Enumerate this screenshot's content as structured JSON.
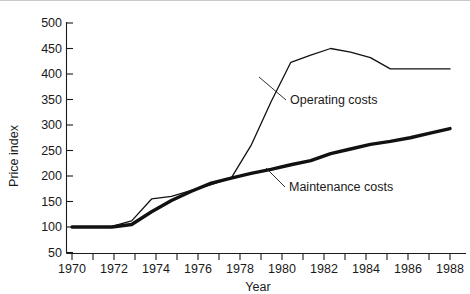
{
  "chart_data": {
    "type": "line",
    "title": "",
    "xlabel": "Year",
    "ylabel": "Price index",
    "xlim": [
      1970,
      1989
    ],
    "ylim": [
      50,
      500
    ],
    "grid": false,
    "legend_position": "inline-annotations",
    "x_ticks_major": [
      1970,
      1972,
      1974,
      1976,
      1978,
      1980,
      1982,
      1984,
      1986,
      1988
    ],
    "x_ticks_minor": [
      1971,
      1973,
      1975,
      1977,
      1979,
      1981,
      1983,
      1985,
      1987,
      1989
    ],
    "y_ticks": [
      50,
      100,
      150,
      200,
      250,
      300,
      350,
      400,
      450,
      500
    ],
    "x": [
      1970,
      1971,
      1972,
      1973,
      1974,
      1975,
      1976,
      1977,
      1978,
      1979,
      1980,
      1981,
      1982,
      1983,
      1984,
      1985,
      1986,
      1987,
      1988,
      1989
    ],
    "series": [
      {
        "name": "Operating costs",
        "style": "thin",
        "values": [
          100,
          100,
          101,
          112,
          155,
          160,
          172,
          183,
          196,
          260,
          345,
          423,
          437,
          450,
          443,
          432,
          410,
          410,
          410,
          410
        ]
      },
      {
        "name": "Maintenance costs",
        "style": "thick",
        "values": [
          100,
          100,
          100,
          105,
          130,
          152,
          170,
          186,
          196,
          205,
          213,
          222,
          230,
          244,
          253,
          262,
          268,
          275,
          284,
          293
        ]
      }
    ],
    "annotations": [
      {
        "text": "Operating costs",
        "label_x": 290,
        "label_y": 103,
        "leader_from_x": 286,
        "leader_from_y": 99,
        "leader_to_x": 259,
        "leader_to_y": 76
      },
      {
        "text": "Maintenance costs",
        "label_x": 289,
        "label_y": 190,
        "leader_from_x": 285,
        "leader_from_y": 186,
        "leader_to_x": 266,
        "leader_to_y": 167
      }
    ]
  },
  "axes": {
    "y_title": "Price index",
    "x_title": "Year",
    "y_tick_labels": [
      "500",
      "450",
      "400",
      "350",
      "300",
      "250",
      "200",
      "150",
      "100",
      "50"
    ],
    "x_tick_labels": [
      "1970",
      "1972",
      "1974",
      "1976",
      "1978",
      "1980",
      "1982",
      "1984",
      "1986",
      "1988"
    ]
  },
  "series_labels": {
    "operating": "Operating costs",
    "maintenance": "Maintenance costs"
  }
}
